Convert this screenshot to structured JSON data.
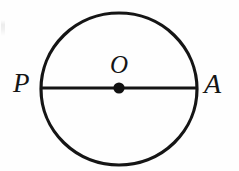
{
  "figure": {
    "kind": "circle-with-diameter",
    "background_color": "#fefefe",
    "stroke_color": "#151515",
    "canvas": {
      "width": 239,
      "height": 171
    },
    "circle": {
      "name": "circle-outline",
      "center_x": 119,
      "center_y": 89,
      "radius_x": 78,
      "radius_y": 76,
      "stroke_width": 3.2
    },
    "diameter": {
      "name": "diameter-segment-PA",
      "x1": 41,
      "y1": 88,
      "x2": 197,
      "y2": 88,
      "stroke_width": 3.2
    },
    "center_point": {
      "name": "center-point-O",
      "cx": 119,
      "cy": 88,
      "radius": 5.6,
      "fill": "#111111"
    },
    "labels": {
      "left": "P",
      "center": "O",
      "right": "A"
    }
  }
}
